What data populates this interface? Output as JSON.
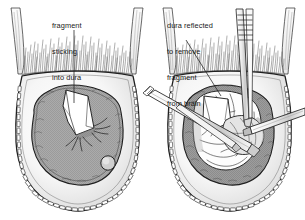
{
  "figure": {
    "type": "medical-surgical-illustration",
    "background_color": "#ffffff",
    "ink_color": "#1a1a1a",
    "panel_count": 2
  },
  "panels": [
    {
      "id": "left-panel",
      "name": "fragment-sticking-into-dura",
      "caption": {
        "lines": [
          "fragment",
          "sticking",
          "into dura"
        ],
        "line1": "fragment",
        "line2": "sticking",
        "line3": "into dura"
      },
      "structures": [
        {
          "name": "hair",
          "label": "hair",
          "color": "#3a3a3a"
        },
        {
          "name": "scalp-flap",
          "label": "scalp flap",
          "color": "#f2f2f2"
        },
        {
          "name": "skull-bone",
          "label": "skull bone",
          "color": "#fafafa"
        },
        {
          "name": "scalp-clips",
          "label": "scalp clips",
          "color": "#ffffff",
          "count": 46
        },
        {
          "name": "dura",
          "label": "dura mater",
          "color": "#a8a8a8"
        },
        {
          "name": "bone-fragment",
          "label": "depressed bone fragment",
          "color": "#ffffff"
        },
        {
          "name": "nodule",
          "label": "small nodule",
          "color": "#d0d0d0"
        }
      ],
      "instruments": []
    },
    {
      "id": "right-panel",
      "name": "dura-reflected-to-remove-fragment",
      "caption": {
        "lines": [
          "dura reflected",
          "to remove",
          "fragment",
          "from brain"
        ],
        "line1": "dura reflected",
        "line2": "to remove",
        "line3": "fragment",
        "line4": "from brain"
      },
      "structures": [
        {
          "name": "hair",
          "label": "hair",
          "color": "#3a3a3a"
        },
        {
          "name": "scalp-flap",
          "label": "scalp flap",
          "color": "#f2f2f2"
        },
        {
          "name": "skull-bone",
          "label": "skull bone",
          "color": "#fafafa"
        },
        {
          "name": "scalp-clips",
          "label": "scalp clips",
          "color": "#ffffff",
          "count": 46
        },
        {
          "name": "dura-reflected",
          "label": "reflected dura",
          "color": "#9e9e9e"
        },
        {
          "name": "brain-surface",
          "label": "exposed brain with gyri",
          "color": "#ffffff"
        },
        {
          "name": "bone-fragment",
          "label": "depressed bone fragment",
          "color": "#ffffff"
        }
      ],
      "instruments": [
        {
          "name": "forceps-vertical",
          "label": "ribbed forceps",
          "orientation": "vertical-top"
        },
        {
          "name": "retractor-left",
          "label": "retractor shaft",
          "orientation": "diagonal-lower-left"
        },
        {
          "name": "probe-right",
          "label": "probe shaft",
          "orientation": "diagonal-right"
        },
        {
          "name": "hook-left",
          "label": "dura hook",
          "orientation": "diagonal-left"
        }
      ]
    }
  ],
  "colors": {
    "ink": "#1a1a1a",
    "dura_gray": "#a8a8a8",
    "dura_gray_dark": "#9a9a9a",
    "scalp_light": "#f4f4f4",
    "bone_white": "#ffffff",
    "shadow_gray": "#cfcfcf",
    "hair_dark": "#404040",
    "background": "#ffffff"
  }
}
